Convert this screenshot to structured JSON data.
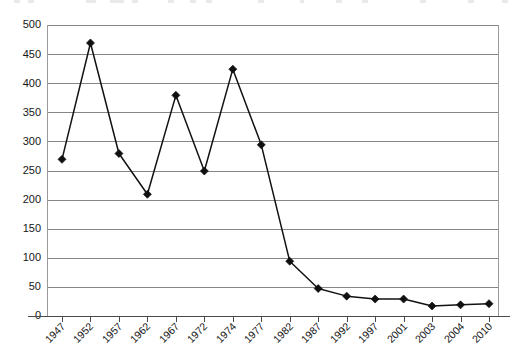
{
  "chart_data": {
    "type": "line",
    "title": "",
    "subtitle": "",
    "xlabel": "",
    "ylabel": "",
    "categories": [
      "1947",
      "1952",
      "1957",
      "1962",
      "1967",
      "1972",
      "1974",
      "1977",
      "1982",
      "1987",
      "1992",
      "1997",
      "2001",
      "2003",
      "2004",
      "2010"
    ],
    "values": [
      270,
      470,
      280,
      210,
      380,
      250,
      425,
      295,
      95,
      48,
      35,
      30,
      30,
      18,
      20,
      22
    ],
    "series": [
      {
        "name": "",
        "marker": "diamond",
        "color": "#101010",
        "values": [
          270,
          470,
          280,
          210,
          380,
          250,
          425,
          295,
          95,
          48,
          35,
          30,
          30,
          18,
          20,
          22
        ]
      }
    ],
    "ylim": [
      0,
      500
    ],
    "ytick_step": 50,
    "yticks": [
      500,
      450,
      400,
      350,
      300,
      250,
      200,
      150,
      100,
      50,
      0
    ],
    "ytick_labels": [
      "500",
      "450",
      "400",
      "350",
      "300",
      "250",
      "200",
      "150",
      "100",
      "50",
      "0"
    ],
    "xtick_labels": [
      "1947",
      "1952",
      "1957",
      "1962",
      "1967",
      "1972",
      "1974",
      "1977",
      "1982",
      "1987",
      "1992",
      "1997",
      "2001",
      "2003",
      "2004",
      "2010"
    ],
    "xtick_rotation_deg": 45,
    "grid": "horizontal",
    "legend": "none",
    "annotations": []
  },
  "style": {
    "plot_background": "#ffffff",
    "gridline_color": "#868686",
    "frame_color": "#9a9a9a",
    "series_color": "#101010",
    "text_color": "#161616"
  }
}
